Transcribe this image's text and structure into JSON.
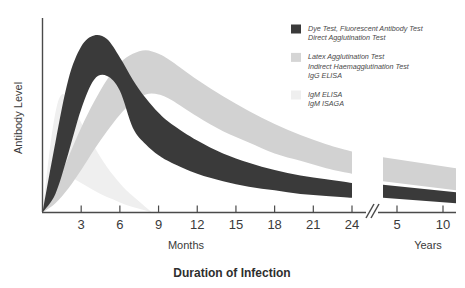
{
  "chart_data": {
    "type": "area",
    "title": "Duration of Infection",
    "xlabel": "Duration of Infection",
    "ylabel": "Antibody Level",
    "grid": false,
    "legend_position": "top-right",
    "x_units": [
      "Months",
      "Years"
    ],
    "x_tick_labels_months": [
      "3",
      "6",
      "9",
      "12",
      "15",
      "18",
      "21",
      "24"
    ],
    "x_tick_labels_years": [
      "5",
      "10"
    ],
    "axis_break": "//",
    "xlim_months": [
      0,
      24
    ],
    "xlim_years": [
      2,
      10
    ],
    "ylim": [
      0,
      100
    ],
    "series": [
      {
        "name": "Dye Test, Fluorescent Antibody Test / Direct Agglutination Test",
        "color": "#3a3a3a",
        "peak_month": 4,
        "peak_value_upper": 96,
        "peak_value_lower": 72,
        "x_months": [
          0,
          1,
          2,
          3,
          4,
          5,
          6,
          7,
          8,
          9,
          10,
          12,
          14,
          16,
          18,
          20,
          22,
          24
        ],
        "upper": [
          0,
          38,
          72,
          90,
          96,
          94,
          84,
          72,
          62,
          54,
          48,
          39,
          32,
          27,
          23,
          20,
          18,
          16
        ],
        "lower": [
          0,
          10,
          32,
          56,
          72,
          74,
          66,
          46,
          37,
          31,
          27,
          21,
          17,
          14,
          12,
          10,
          9,
          8
        ],
        "years_x": [
          4.5,
          10
        ],
        "years_upper": [
          15,
          11
        ],
        "years_lower": [
          8,
          5
        ]
      },
      {
        "name": "Latex Agglutination Test / Indirect Haemagglutination Test / IgG ELISA",
        "color": "#d2d2d2",
        "peak_month": 8,
        "peak_value_upper": 88,
        "peak_value_lower": 66,
        "x_months": [
          0,
          1,
          2,
          3,
          4,
          5,
          6,
          7,
          8,
          9,
          10,
          12,
          14,
          16,
          18,
          20,
          22,
          24
        ],
        "upper": [
          0,
          14,
          30,
          46,
          60,
          72,
          81,
          86,
          88,
          86,
          82,
          72,
          63,
          55,
          48,
          42,
          37,
          33
        ],
        "lower": [
          0,
          5,
          13,
          23,
          34,
          44,
          53,
          60,
          64,
          64,
          61,
          52,
          44,
          38,
          32,
          28,
          24,
          21
        ],
        "years_x": [
          4.5,
          10
        ],
        "years_upper": [
          30,
          24
        ],
        "years_lower": [
          17,
          12
        ]
      },
      {
        "name": "IgM ELISA / IgM ISAGA",
        "color": "#efefef",
        "peak_month": 1.5,
        "peak_value_upper": 64,
        "peak_value_lower": 40,
        "x_months": [
          0,
          0.8,
          1.5,
          2.5,
          3.5,
          4.5,
          5.5,
          6.5,
          7.5,
          8.5
        ],
        "upper": [
          0,
          46,
          64,
          55,
          42,
          30,
          20,
          12,
          6,
          0
        ],
        "lower": [
          0,
          14,
          22,
          18,
          14,
          10,
          7,
          4,
          2,
          0
        ],
        "years_x": [],
        "years_upper": [],
        "years_lower": []
      }
    ],
    "legend_entries": [
      {
        "swatch_color": "#3a3a3a",
        "lines": [
          "Dye Test, Fluorescent Antibody Test",
          "Direct Agglutination Test"
        ]
      },
      {
        "swatch_color": "#d5d5d5",
        "lines": [
          "Latex Agglutination Test",
          "Indirect Haemagglutination Test",
          "IgG ELISA"
        ]
      },
      {
        "swatch_color": "#efefef",
        "lines": [
          "IgM ELISA",
          "IgM ISAGA"
        ]
      }
    ]
  },
  "axes": {
    "y_label": "Antibody Level",
    "months_label": "Months",
    "years_label": "Years",
    "break_glyph": "//"
  },
  "colors": {
    "dark_band": "#3a3a3a",
    "mid_band": "#d2d2d2",
    "light_band": "#efefef",
    "axis": "#4a4a4a",
    "text": "#3a3a3a"
  }
}
